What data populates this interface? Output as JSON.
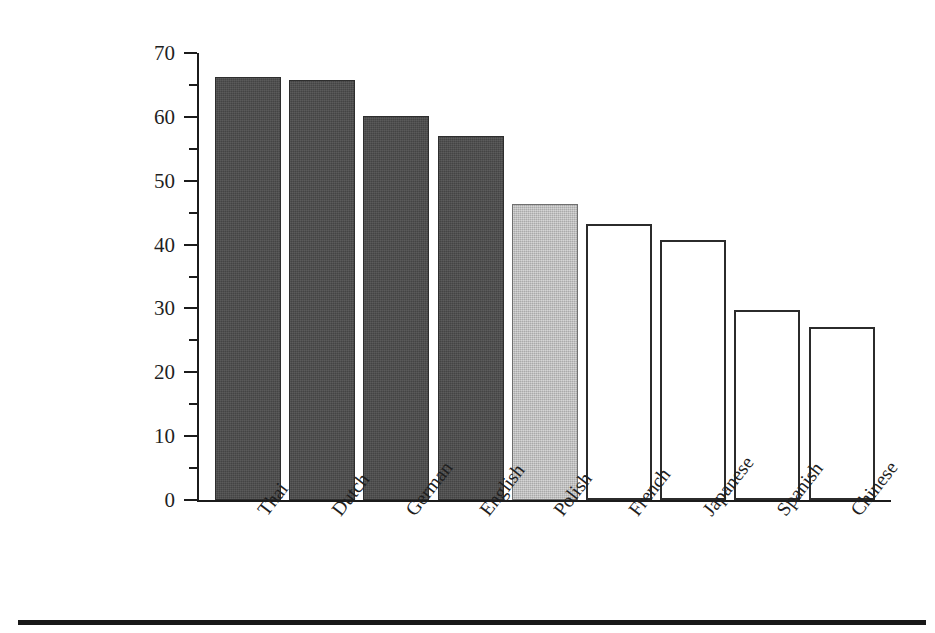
{
  "chart_data": {
    "type": "bar",
    "title": "",
    "subtitle": "",
    "xlabel": "",
    "ylabel": "Vowel length Pairwise Variability Index",
    "ylabel_lines": [
      "Vowel length",
      "Pairwise Variability Index"
    ],
    "categories": [
      "Thai",
      "Dutch",
      "German",
      "English",
      "Polish",
      "French",
      "Japanese",
      "Spanish",
      "Chinese"
    ],
    "values": [
      66.2,
      65.8,
      60.1,
      57.0,
      46.3,
      43.2,
      40.7,
      29.7,
      27.1
    ],
    "bar_styles": [
      "dark",
      "dark",
      "dark",
      "dark",
      "light",
      "open",
      "open",
      "open",
      "open"
    ],
    "ylim": [
      0,
      70
    ],
    "xlim_categories": 9,
    "y_major_ticks": [
      0,
      10,
      20,
      30,
      40,
      50,
      60,
      70
    ],
    "y_minor_ticks": [
      5,
      15,
      25,
      35,
      45,
      55,
      65
    ],
    "y_tick_labels": [
      "0",
      "10",
      "20",
      "30",
      "40",
      "50",
      "60",
      "70"
    ],
    "grid": false,
    "legend": false,
    "legend_position": "none",
    "colors": {
      "dark_bar": "#4b4b4b",
      "light_bar": "#bcbcbc",
      "open_bar": "#ffffff",
      "bar_outline": "#2b2b2b",
      "axis": "#1b1b1b",
      "text": "#1f1f1f",
      "rule": "#181818",
      "background": "#ffffff"
    }
  }
}
